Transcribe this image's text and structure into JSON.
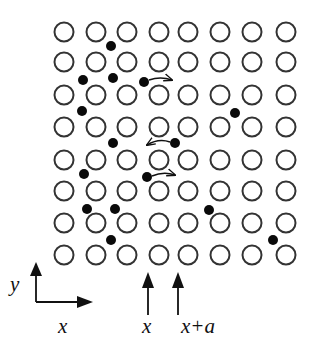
{
  "figure": {
    "lattice": {
      "columns_x": [
        64,
        96,
        127,
        159,
        188,
        220,
        252,
        286
      ],
      "rows_y": [
        32,
        62,
        95,
        127,
        160,
        191,
        223,
        255
      ],
      "radius": 9.5,
      "stroke": "#333333"
    },
    "interstitials": [
      {
        "x": 111,
        "y": 46
      },
      {
        "x": 83,
        "y": 80
      },
      {
        "x": 113,
        "y": 78
      },
      {
        "x": 144,
        "y": 82
      },
      {
        "x": 82,
        "y": 111
      },
      {
        "x": 235,
        "y": 113
      },
      {
        "x": 113,
        "y": 143
      },
      {
        "x": 175,
        "y": 143
      },
      {
        "x": 84,
        "y": 174
      },
      {
        "x": 147,
        "y": 177
      },
      {
        "x": 209,
        "y": 210
      },
      {
        "x": 87,
        "y": 209
      },
      {
        "x": 115,
        "y": 209
      },
      {
        "x": 111,
        "y": 240
      },
      {
        "x": 273,
        "y": 240
      }
    ],
    "dot_radius": 5,
    "jump_arrows": [
      {
        "from": [
          149,
          80
        ],
        "to": [
          172,
          80
        ],
        "direction": "right"
      },
      {
        "from": [
          170,
          142
        ],
        "to": [
          147,
          145
        ],
        "direction": "left"
      },
      {
        "from": [
          152,
          176
        ],
        "to": [
          175,
          175
        ],
        "direction": "right"
      }
    ],
    "axes": {
      "origin": [
        36,
        302
      ],
      "y_end": [
        36,
        262
      ],
      "x_end": [
        93,
        302
      ],
      "y_label": "y",
      "x_label": "x"
    },
    "plane_markers": [
      {
        "x": 148,
        "label": "x"
      },
      {
        "x": 178,
        "label": "x+a"
      }
    ]
  }
}
